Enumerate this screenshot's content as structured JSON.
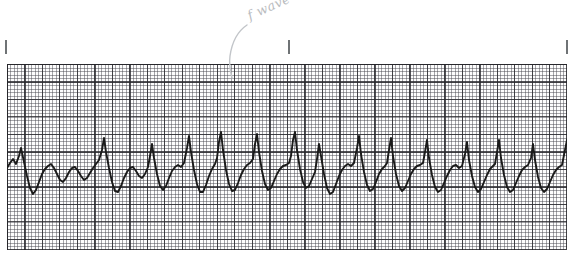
{
  "document": {
    "kind": "ecg-rhythm-strip",
    "title": "ECG rhythm strip",
    "rhythm_interpretation": "Atrial flutter / fibrillation with sawtooth f waves"
  },
  "annotation": {
    "label": "f wave",
    "leader_line": "curved leader from label down-left to the baseline deflection",
    "color": "#b9bcc0"
  },
  "grid": {
    "small_square_px": 3.5,
    "large_square_px": 17.5,
    "small_square_time_s": 0.04,
    "large_square_time_s": 0.2,
    "fine_line_color": "#46464e",
    "bold_line_color": "#282830",
    "paper_color": "#fdfdfd",
    "left": 7,
    "top": 64,
    "width": 560,
    "height": 186
  },
  "interval_ticks": {
    "label": "3-second interval markers",
    "color": "#6f7375",
    "positions_px": [
      5,
      288,
      566
    ],
    "top_px": 40,
    "height_px": 14
  },
  "trace": {
    "color": "#1a1a1a",
    "stroke_width": 1.9,
    "baseline_y": 105,
    "qrs_peaks_px": [
      12,
      48,
      97,
      143,
      180,
      212,
      248,
      286,
      310,
      350,
      382,
      418,
      458,
      490,
      524,
      558
    ],
    "description": "Narrow QRS complexes at irregular intervals with continuous undulating sawtooth flutter waves along the baseline"
  },
  "chart_data": {
    "type": "line",
    "xlabel": "Time",
    "ylabel": "Amplitude",
    "grid": true,
    "legend": "none",
    "xlim": [
      0,
      560
    ],
    "ylim": [
      0,
      186
    ],
    "series": [
      {
        "name": "ECG lead",
        "points": [
          [
            0,
            104
          ],
          [
            3,
            99
          ],
          [
            6,
            95
          ],
          [
            9,
            100
          ],
          [
            12,
            92
          ],
          [
            14,
            84
          ],
          [
            17,
            98
          ],
          [
            20,
            112
          ],
          [
            23,
            124
          ],
          [
            26,
            130
          ],
          [
            29,
            126
          ],
          [
            32,
            118
          ],
          [
            35,
            110
          ],
          [
            38,
            105
          ],
          [
            41,
            102
          ],
          [
            44,
            100
          ],
          [
            47,
            104
          ],
          [
            50,
            110
          ],
          [
            53,
            116
          ],
          [
            56,
            118
          ],
          [
            59,
            114
          ],
          [
            62,
            108
          ],
          [
            65,
            104
          ],
          [
            68,
            103
          ],
          [
            71,
            107
          ],
          [
            74,
            112
          ],
          [
            77,
            116
          ],
          [
            80,
            114
          ],
          [
            83,
            109
          ],
          [
            86,
            104
          ],
          [
            89,
            100
          ],
          [
            92,
            96
          ],
          [
            95,
            86
          ],
          [
            97,
            74
          ],
          [
            99,
            88
          ],
          [
            102,
            104
          ],
          [
            105,
            118
          ],
          [
            108,
            127
          ],
          [
            111,
            128
          ],
          [
            114,
            122
          ],
          [
            117,
            114
          ],
          [
            120,
            108
          ],
          [
            123,
            104
          ],
          [
            126,
            103
          ],
          [
            129,
            107
          ],
          [
            132,
            112
          ],
          [
            135,
            114
          ],
          [
            138,
            110
          ],
          [
            141,
            103
          ],
          [
            143,
            92
          ],
          [
            145,
            80
          ],
          [
            147,
            94
          ],
          [
            150,
            110
          ],
          [
            153,
            122
          ],
          [
            156,
            126
          ],
          [
            159,
            122
          ],
          [
            162,
            114
          ],
          [
            165,
            107
          ],
          [
            168,
            103
          ],
          [
            171,
            101
          ],
          [
            174,
            103
          ],
          [
            177,
            99
          ],
          [
            180,
            84
          ],
          [
            182,
            72
          ],
          [
            184,
            88
          ],
          [
            187,
            106
          ],
          [
            190,
            120
          ],
          [
            193,
            128
          ],
          [
            196,
            128
          ],
          [
            199,
            121
          ],
          [
            202,
            112
          ],
          [
            205,
            105
          ],
          [
            208,
            100
          ],
          [
            210,
            94
          ],
          [
            212,
            78
          ],
          [
            214,
            68
          ],
          [
            216,
            86
          ],
          [
            219,
            106
          ],
          [
            222,
            120
          ],
          [
            225,
            127
          ],
          [
            228,
            126
          ],
          [
            231,
            119
          ],
          [
            234,
            111
          ],
          [
            237,
            105
          ],
          [
            240,
            101
          ],
          [
            243,
            99
          ],
          [
            246,
            95
          ],
          [
            248,
            80
          ],
          [
            250,
            70
          ],
          [
            252,
            88
          ],
          [
            255,
            107
          ],
          [
            258,
            120
          ],
          [
            261,
            126
          ],
          [
            264,
            124
          ],
          [
            267,
            117
          ],
          [
            270,
            110
          ],
          [
            273,
            105
          ],
          [
            276,
            102
          ],
          [
            279,
            101
          ],
          [
            282,
            99
          ],
          [
            284,
            92
          ],
          [
            286,
            76
          ],
          [
            288,
            68
          ],
          [
            290,
            86
          ],
          [
            293,
            105
          ],
          [
            296,
            118
          ],
          [
            299,
            124
          ],
          [
            302,
            122
          ],
          [
            305,
            115
          ],
          [
            308,
            108
          ],
          [
            310,
            95
          ],
          [
            312,
            80
          ],
          [
            314,
            92
          ],
          [
            317,
            110
          ],
          [
            320,
            124
          ],
          [
            323,
            130
          ],
          [
            326,
            128
          ],
          [
            329,
            120
          ],
          [
            332,
            112
          ],
          [
            335,
            106
          ],
          [
            338,
            102
          ],
          [
            341,
            100
          ],
          [
            344,
            102
          ],
          [
            347,
            99
          ],
          [
            350,
            84
          ],
          [
            352,
            72
          ],
          [
            354,
            90
          ],
          [
            357,
            108
          ],
          [
            360,
            121
          ],
          [
            363,
            127
          ],
          [
            366,
            125
          ],
          [
            369,
            118
          ],
          [
            372,
            110
          ],
          [
            375,
            105
          ],
          [
            378,
            102
          ],
          [
            380,
            99
          ],
          [
            382,
            86
          ],
          [
            384,
            74
          ],
          [
            386,
            92
          ],
          [
            389,
            110
          ],
          [
            392,
            122
          ],
          [
            395,
            127
          ],
          [
            398,
            124
          ],
          [
            401,
            117
          ],
          [
            404,
            110
          ],
          [
            407,
            105
          ],
          [
            410,
            102
          ],
          [
            413,
            101
          ],
          [
            416,
            99
          ],
          [
            418,
            88
          ],
          [
            420,
            76
          ],
          [
            422,
            94
          ],
          [
            425,
            111
          ],
          [
            428,
            123
          ],
          [
            431,
            128
          ],
          [
            434,
            126
          ],
          [
            437,
            119
          ],
          [
            440,
            112
          ],
          [
            443,
            106
          ],
          [
            446,
            102
          ],
          [
            449,
            101
          ],
          [
            452,
            104
          ],
          [
            455,
            102
          ],
          [
            458,
            90
          ],
          [
            460,
            78
          ],
          [
            462,
            96
          ],
          [
            465,
            112
          ],
          [
            468,
            123
          ],
          [
            471,
            128
          ],
          [
            474,
            125
          ],
          [
            477,
            118
          ],
          [
            480,
            111
          ],
          [
            483,
            105
          ],
          [
            486,
            102
          ],
          [
            488,
            100
          ],
          [
            490,
            88
          ],
          [
            492,
            76
          ],
          [
            494,
            94
          ],
          [
            497,
            111
          ],
          [
            500,
            123
          ],
          [
            503,
            128
          ],
          [
            506,
            126
          ],
          [
            509,
            119
          ],
          [
            512,
            112
          ],
          [
            515,
            106
          ],
          [
            518,
            103
          ],
          [
            521,
            101
          ],
          [
            524,
            94
          ],
          [
            526,
            80
          ],
          [
            528,
            96
          ],
          [
            531,
            113
          ],
          [
            534,
            124
          ],
          [
            537,
            128
          ],
          [
            540,
            125
          ],
          [
            543,
            118
          ],
          [
            546,
            111
          ],
          [
            549,
            106
          ],
          [
            552,
            103
          ],
          [
            555,
            101
          ],
          [
            558,
            86
          ],
          [
            560,
            76
          ]
        ]
      }
    ]
  }
}
